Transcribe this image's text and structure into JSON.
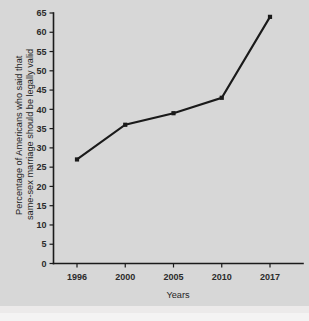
{
  "chart_data": {
    "type": "line",
    "title": "",
    "xlabel": "Years",
    "ylabel_line1": "Percentage of Americans who said that",
    "ylabel_line2": "same-sex marriage should be legally valid",
    "categories": [
      "1996",
      "2000",
      "2005",
      "2010",
      "2017"
    ],
    "x": [
      1996,
      2000,
      2005,
      2010,
      2017
    ],
    "values": [
      27,
      36,
      39,
      43,
      64
    ],
    "series": [
      {
        "name": "Percentage who said same-sex marriage should be legally valid",
        "values": [
          27,
          36,
          39,
          43,
          64
        ]
      }
    ],
    "ylim": [
      0,
      65
    ],
    "ytick_labels": [
      "0",
      "5",
      "10",
      "15",
      "20",
      "25",
      "30",
      "35",
      "40",
      "45",
      "50",
      "55",
      "60",
      "65"
    ],
    "ytick_values": [
      0,
      5,
      10,
      15,
      20,
      25,
      30,
      35,
      40,
      45,
      50,
      55,
      60,
      65
    ],
    "xtick_labels": [
      "1996",
      "2000",
      "2005",
      "2010",
      "2017"
    ],
    "grid": false,
    "legend": false,
    "legend_position": "none",
    "marker": "square",
    "line_color": "#1a1a1a",
    "background_color": "#d7d7d7"
  },
  "axis_titles": {
    "y_line1": "Percentage of Americans who said that",
    "y_line2": "same-sex marriage should be legally valid",
    "x": "Years"
  }
}
